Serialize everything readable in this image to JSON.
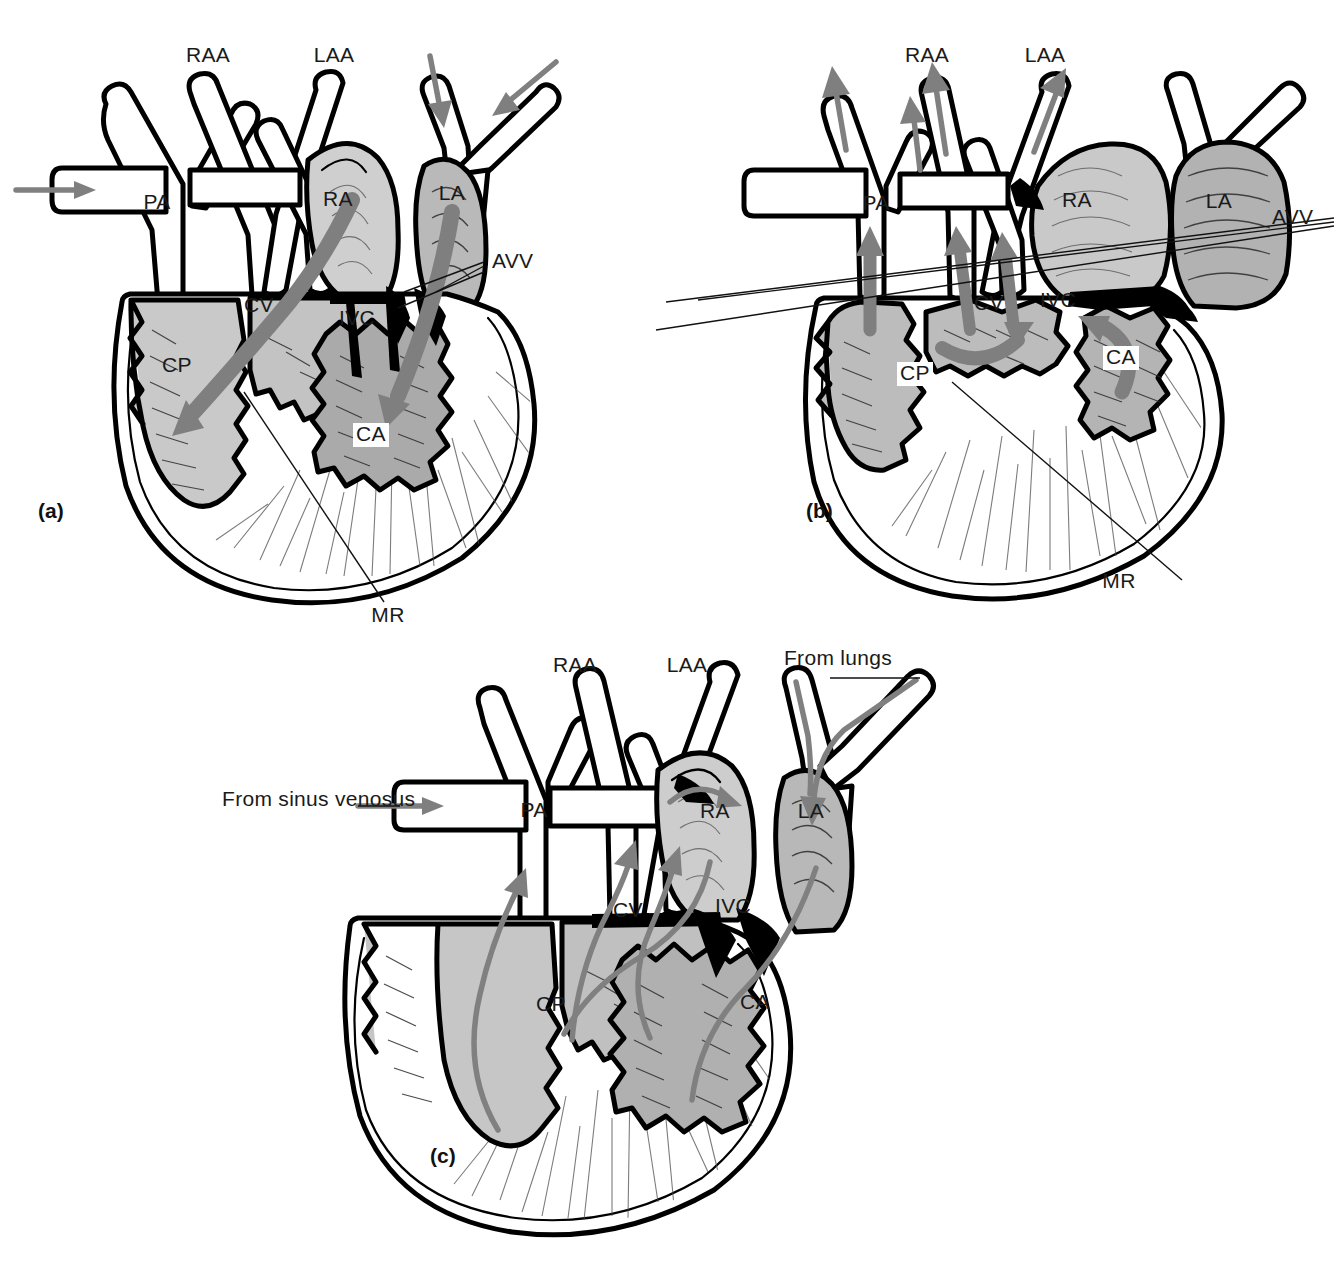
{
  "figure": {
    "background_color": "#ffffff",
    "line_color": "#000000",
    "flow_arrow_color": "#7f7f7f",
    "chamber_light_color": "#c9c9c9",
    "chamber_mid_color": "#b4b4b4",
    "chamber_dark_color": "#9e9e9e"
  },
  "panels": [
    {
      "id": "a",
      "tag": "(a)",
      "tag_x": 38,
      "tag_y": 518,
      "labels": [
        {
          "name": "raa",
          "text": "RAA",
          "x": 208,
          "y": 62,
          "anchor": "middle",
          "boxed": false
        },
        {
          "name": "laa",
          "text": "LAA",
          "x": 334,
          "y": 62,
          "anchor": "middle",
          "boxed": false
        },
        {
          "name": "pa",
          "text": "PA",
          "x": 157,
          "y": 209,
          "anchor": "middle",
          "boxed": false
        },
        {
          "name": "ra",
          "text": "RA",
          "x": 338,
          "y": 206,
          "anchor": "middle",
          "boxed": false
        },
        {
          "name": "la",
          "text": "LA",
          "x": 452,
          "y": 200,
          "anchor": "middle",
          "boxed": false
        },
        {
          "name": "avv",
          "text": "AVV",
          "x": 492,
          "y": 268,
          "anchor": "start",
          "boxed": false
        },
        {
          "name": "cv",
          "text": "CV",
          "x": 259,
          "y": 312,
          "anchor": "middle",
          "boxed": false
        },
        {
          "name": "ivc",
          "text": "IVC",
          "x": 357,
          "y": 325,
          "anchor": "middle",
          "boxed": false
        },
        {
          "name": "cp",
          "text": "CP",
          "x": 177,
          "y": 372,
          "anchor": "middle",
          "boxed": false
        },
        {
          "name": "ca",
          "text": "CA",
          "x": 371,
          "y": 441,
          "anchor": "middle",
          "boxed": true
        },
        {
          "name": "mr",
          "text": "MR",
          "x": 388,
          "y": 622,
          "anchor": "middle",
          "boxed": false
        }
      ]
    },
    {
      "id": "b",
      "tag": "(b)",
      "tag_x": 806,
      "tag_y": 518,
      "labels": [
        {
          "name": "raa",
          "text": "RAA",
          "x": 927,
          "y": 62,
          "anchor": "middle",
          "boxed": false
        },
        {
          "name": "laa",
          "text": "LAA",
          "x": 1045,
          "y": 62,
          "anchor": "middle",
          "boxed": false
        },
        {
          "name": "pa",
          "text": "PA",
          "x": 876,
          "y": 210,
          "anchor": "middle",
          "boxed": false
        },
        {
          "name": "ra",
          "text": "RA",
          "x": 1077,
          "y": 207,
          "anchor": "middle",
          "boxed": false
        },
        {
          "name": "la",
          "text": "LA",
          "x": 1219,
          "y": 208,
          "anchor": "middle",
          "boxed": false
        },
        {
          "name": "avv",
          "text": "AVV",
          "x": 1272,
          "y": 224,
          "anchor": "start",
          "boxed": false
        },
        {
          "name": "cv",
          "text": "CV",
          "x": 989,
          "y": 310,
          "anchor": "middle",
          "boxed": false
        },
        {
          "name": "ivc",
          "text": "IVC",
          "x": 1058,
          "y": 307,
          "anchor": "middle",
          "boxed": false
        },
        {
          "name": "cp",
          "text": "CP",
          "x": 915,
          "y": 380,
          "anchor": "middle",
          "boxed": true
        },
        {
          "name": "ca",
          "text": "CA",
          "x": 1121,
          "y": 364,
          "anchor": "middle",
          "boxed": true
        },
        {
          "name": "mr",
          "text": "MR",
          "x": 1119,
          "y": 588,
          "anchor": "middle",
          "boxed": false
        }
      ]
    },
    {
      "id": "c",
      "tag": "(c)",
      "tag_x": 430,
      "tag_y": 1163,
      "labels": [
        {
          "name": "raa",
          "text": "RAA",
          "x": 575,
          "y": 672,
          "anchor": "middle",
          "boxed": false
        },
        {
          "name": "laa",
          "text": "LAA",
          "x": 687,
          "y": 672,
          "anchor": "middle",
          "boxed": false
        },
        {
          "name": "from-lungs",
          "text": "From lungs",
          "x": 838,
          "y": 665,
          "anchor": "middle",
          "boxed": false
        },
        {
          "name": "from-sinus-venosus",
          "text": "From sinus venosus",
          "x": 222,
          "y": 806,
          "anchor": "start",
          "boxed": false
        },
        {
          "name": "pa",
          "text": "PA",
          "x": 534,
          "y": 817,
          "anchor": "middle",
          "boxed": false
        },
        {
          "name": "ra",
          "text": "RA",
          "x": 715,
          "y": 818,
          "anchor": "middle",
          "boxed": false
        },
        {
          "name": "la",
          "text": "LA",
          "x": 811,
          "y": 818,
          "anchor": "middle",
          "boxed": false
        },
        {
          "name": "cv",
          "text": "CV",
          "x": 628,
          "y": 917,
          "anchor": "middle",
          "boxed": false
        },
        {
          "name": "ivc",
          "text": "IVC",
          "x": 733,
          "y": 913,
          "anchor": "middle",
          "boxed": false
        },
        {
          "name": "cp",
          "text": "CP",
          "x": 551,
          "y": 1011,
          "anchor": "middle",
          "boxed": false
        },
        {
          "name": "ca",
          "text": "CA",
          "x": 755,
          "y": 1009,
          "anchor": "middle",
          "boxed": false
        }
      ]
    }
  ],
  "abbreviations": {
    "RAA": "right aortic arch",
    "LAA": "left aortic arch",
    "PA": "pulmonary artery",
    "RA": "right atrium",
    "LA": "left atrium",
    "AVV": "atrioventricular valve",
    "CV": "cavum venosum",
    "IVC": "interventricular canal",
    "CP": "cavum pulmonale",
    "CA": "cavum arteriosum",
    "MR": "muscular ridge"
  }
}
